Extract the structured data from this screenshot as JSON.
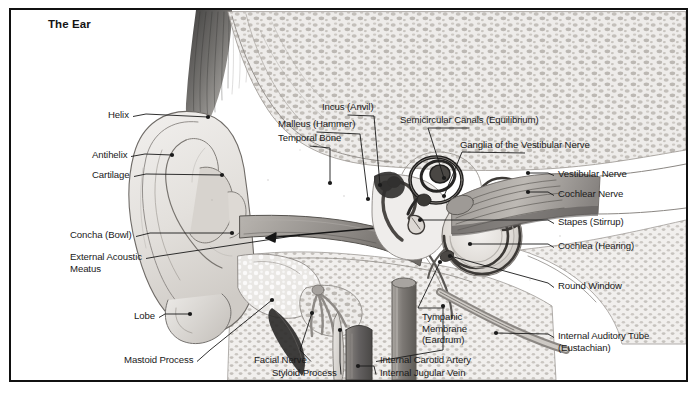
{
  "figure": {
    "title": "The Ear",
    "kind": "anatomical-illustration",
    "border_color": "#111111",
    "background_color": "#ffffff",
    "ink_color": "#1a1a1a"
  },
  "arrow": {
    "name": "sound-path-arrow",
    "description": "double-headed arrow in external acoustic meatus"
  },
  "labels": [
    {
      "id": "helix",
      "text": "Helix",
      "side": "left",
      "text_x": 108,
      "text_y": 109,
      "anchor": "right",
      "end_x": 208,
      "end_y": 117,
      "bend_x": 146,
      "bend_y": 114,
      "dot": true
    },
    {
      "id": "antihelix",
      "text": "Antihelix",
      "side": "left",
      "text_x": 92,
      "text_y": 149,
      "anchor": "right",
      "end_x": 172,
      "end_y": 155,
      "bend_x": 145,
      "bend_y": 154,
      "dot": true
    },
    {
      "id": "cartilage",
      "text": "Cartilage",
      "side": "left",
      "text_x": 92,
      "text_y": 169,
      "anchor": "right",
      "end_x": 222,
      "end_y": 175,
      "bend_x": 146,
      "bend_y": 174,
      "dot": true
    },
    {
      "id": "concha-bowl",
      "text": "Concha (Bowl)",
      "side": "left",
      "text_x": 70,
      "text_y": 229,
      "anchor": "right",
      "end_x": 232,
      "end_y": 233,
      "bend_x": 150,
      "bend_y": 233,
      "dot": true
    },
    {
      "id": "external-acoustic-meatus",
      "text": "External Acoustic\nMeatus",
      "side": "left",
      "text_x": 70,
      "text_y": 251,
      "anchor": "right",
      "end_x": 300,
      "end_y": 235,
      "bend_x": 160,
      "bend_y": 256,
      "dot": false
    },
    {
      "id": "lobe",
      "text": "Lobe",
      "side": "left",
      "text_x": 134,
      "text_y": 310,
      "anchor": "right",
      "end_x": 190,
      "end_y": 314,
      "bend_x": 165,
      "bend_y": 314,
      "dot": true
    },
    {
      "id": "mastoid-process",
      "text": "Mastoid Process",
      "side": "left",
      "text_x": 124,
      "text_y": 354,
      "anchor": "right",
      "end_x": 272,
      "end_y": 300,
      "bend_x": 210,
      "bend_y": 350,
      "dot": true
    },
    {
      "id": "facial-nerve",
      "text": "Facial Nerve",
      "side": "bottom",
      "text_x": 254,
      "text_y": 354,
      "anchor": "right",
      "end_x": 312,
      "end_y": 313,
      "bend_x": 300,
      "bend_y": 350,
      "dot": true
    },
    {
      "id": "styloid-process",
      "text": "Styloid Process",
      "side": "bottom",
      "text_x": 272,
      "text_y": 367,
      "anchor": "right",
      "end_x": 340,
      "end_y": 330,
      "bend_x": 340,
      "bend_y": 362,
      "dot": true
    },
    {
      "id": "temporal-bone",
      "text": "Temporal Bone",
      "side": "top",
      "text_x": 278,
      "text_y": 132,
      "anchor": "bottom",
      "end_x": 330,
      "end_y": 183,
      "bend_x": 330,
      "bend_y": 148,
      "dot": true
    },
    {
      "id": "malleus-hammer",
      "text": "Malleus (Hammer)",
      "side": "top",
      "text_x": 278,
      "text_y": 118,
      "anchor": "bottom",
      "end_x": 368,
      "end_y": 199,
      "bend_x": 360,
      "bend_y": 134,
      "dot": true
    },
    {
      "id": "incus-anvil",
      "text": "Incus (Anvil)",
      "side": "top",
      "text_x": 322,
      "text_y": 101,
      "anchor": "bottom",
      "end_x": 380,
      "end_y": 185,
      "bend_x": 374,
      "bend_y": 116,
      "dot": true
    },
    {
      "id": "semicircular-canals",
      "text": "Semicircular Canals (Equilibrium)",
      "side": "top",
      "text_x": 400,
      "text_y": 114,
      "anchor": "bottom",
      "end_x": 444,
      "end_y": 178,
      "bend_x": 428,
      "bend_y": 128,
      "dot": true
    },
    {
      "id": "ganglia-vestibular-nerve",
      "text": "Ganglia of the Vestibular Nerve",
      "side": "top",
      "text_x": 460,
      "text_y": 139,
      "anchor": "bottom",
      "end_x": 444,
      "end_y": 196,
      "bend_x": 462,
      "bend_y": 152,
      "dot": true
    },
    {
      "id": "vestibular-nerve",
      "text": "Vestibular Nerve",
      "side": "right",
      "text_x": 558,
      "text_y": 168,
      "anchor": "left",
      "end_x": 528,
      "end_y": 173,
      "bend_x": 548,
      "bend_y": 173,
      "dot": true
    },
    {
      "id": "cochlear-nerve",
      "text": "Cochlear Nerve",
      "side": "right",
      "text_x": 558,
      "text_y": 188,
      "anchor": "left",
      "end_x": 528,
      "end_y": 192,
      "bend_x": 548,
      "bend_y": 192,
      "dot": true
    },
    {
      "id": "stapes-stirrup",
      "text": "Stapes (Stirrup)",
      "side": "right",
      "text_x": 558,
      "text_y": 216,
      "anchor": "left",
      "end_x": 420,
      "end_y": 220,
      "bend_x": 548,
      "bend_y": 220,
      "dot": true
    },
    {
      "id": "cochlea-hearing",
      "text": "Cochlea (Hearing)",
      "side": "right",
      "text_x": 558,
      "text_y": 240,
      "anchor": "left",
      "end_x": 470,
      "end_y": 244,
      "bend_x": 548,
      "bend_y": 244,
      "dot": true
    },
    {
      "id": "round-window",
      "text": "Round Window",
      "side": "right",
      "text_x": 558,
      "text_y": 280,
      "anchor": "left",
      "end_x": 450,
      "end_y": 256,
      "bend_x": 548,
      "bend_y": 283,
      "dot": true
    },
    {
      "id": "internal-auditory-tube",
      "text": "Internal Auditory Tube\n(Eustachian)",
      "side": "right",
      "text_x": 558,
      "text_y": 330,
      "anchor": "left",
      "end_x": 496,
      "end_y": 333,
      "bend_x": 548,
      "bend_y": 334,
      "dot": true
    },
    {
      "id": "tympanic-membrane",
      "text": "Tympanic\nMembrane\n(Eardrum)",
      "side": "bottom",
      "text_x": 422,
      "text_y": 311,
      "anchor": "top",
      "end_x": 440,
      "end_y": 262,
      "bend_x": 418,
      "bend_y": 308,
      "dot": true
    },
    {
      "id": "internal-carotid-artery",
      "text": "Internal Carotid Artery",
      "side": "bottom",
      "text_x": 380,
      "text_y": 354,
      "anchor": "left",
      "end_x": 443,
      "end_y": 306,
      "bend_x": 443,
      "bend_y": 350,
      "dot": true
    },
    {
      "id": "internal-jugular-vein",
      "text": "Internal Jugular Vein",
      "side": "bottom",
      "text_x": 380,
      "text_y": 367,
      "anchor": "left",
      "end_x": 358,
      "end_y": 366,
      "bend_x": 374,
      "bend_y": 366,
      "dot": true
    }
  ]
}
